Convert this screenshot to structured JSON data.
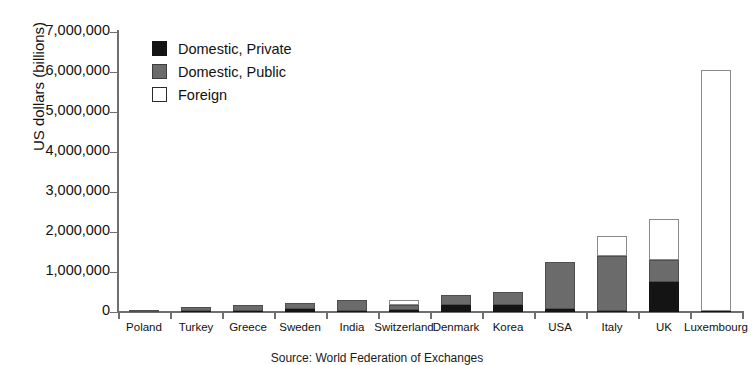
{
  "chart_data": {
    "type": "bar",
    "subtype": "stacked-vertical",
    "title": "",
    "xlabel": "",
    "ylabel": "US dollars (billions)",
    "ylim": [
      0,
      7000000
    ],
    "ytick_step": 1000000,
    "ytick_labels": [
      "0",
      "1,000,000",
      "2,000,000",
      "3,000,000",
      "4,000,000",
      "5,000,000",
      "6,000,000",
      "7,000,000"
    ],
    "ytick_values": [
      0,
      1000000,
      2000000,
      3000000,
      4000000,
      5000000,
      6000000,
      7000000
    ],
    "grid": false,
    "legend_position": "top-left",
    "categories": [
      "Poland",
      "Turkey",
      "Greece",
      "Sweden",
      "India",
      "Switzerland",
      "Denmark",
      "Korea",
      "USA",
      "Italy",
      "UK",
      "Luxembourg"
    ],
    "series": [
      {
        "name": "Domestic, Private",
        "color": "#141414",
        "values": [
          10000,
          15000,
          20000,
          80000,
          20000,
          60000,
          180000,
          170000,
          80000,
          30000,
          750000,
          30000
        ]
      },
      {
        "name": "Domestic, Public",
        "color": "#6b6b6b",
        "values": [
          40000,
          110000,
          160000,
          140000,
          270000,
          110000,
          250000,
          330000,
          1170000,
          1370000,
          550000,
          0
        ]
      },
      {
        "name": "Foreign",
        "color": "#ffffff",
        "values": [
          0,
          0,
          0,
          0,
          0,
          140000,
          0,
          0,
          0,
          500000,
          1030000,
          6020000
        ]
      }
    ],
    "totals": [
      50000,
      125000,
      180000,
      220000,
      290000,
      310000,
      430000,
      500000,
      1250000,
      1900000,
      2330000,
      6050000
    ]
  },
  "legend": {
    "items": [
      {
        "label": "Domestic, Private",
        "swatch": "black-filled-square"
      },
      {
        "label": "Domestic, Public",
        "swatch": "gray-filled-square"
      },
      {
        "label": "Foreign",
        "swatch": "white-outlined-square"
      }
    ]
  },
  "source": {
    "text": "Source: World Federation of Exchanges"
  }
}
